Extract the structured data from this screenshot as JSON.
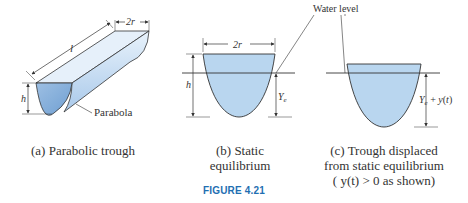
{
  "figure": {
    "number_label": "FIGURE 4.21",
    "colors": {
      "water_fill": "#b9d6ef",
      "water_fill_dark": "#8fb6dd",
      "trough_side": "#d8e9f7",
      "outline": "#333333",
      "figure_label": "#1f6fb2"
    }
  },
  "panel_a": {
    "caption": "(a) Parabolic trough",
    "labels": {
      "width": "2r",
      "length": "l",
      "height": "h",
      "shape": "Parabola"
    }
  },
  "panel_b": {
    "caption_line1": "(b) Static",
    "caption_line2": "equilibrium",
    "labels": {
      "width": "2r",
      "height": "h",
      "depth": "Ye"
    }
  },
  "panel_c": {
    "caption_line1": "(c) Trough displaced",
    "caption_line2": "from static equilibrium",
    "caption_line3": "( y(t) > 0 as shown)",
    "labels": {
      "depth": "Ye + y(t)"
    }
  },
  "shared": {
    "water_level_label": "Water level"
  }
}
